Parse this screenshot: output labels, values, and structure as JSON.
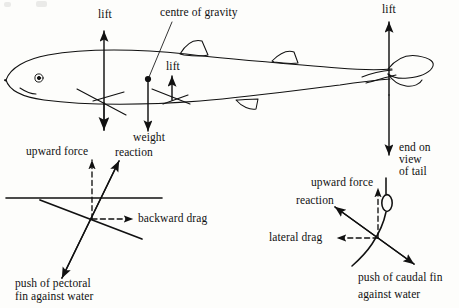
{
  "figure": {
    "domain": "diagram",
    "background_color": "#fdfdfb",
    "ink_color": "#111111"
  },
  "main_view": {
    "name": "shark-side-view",
    "labels": {
      "lift_front": "lift",
      "lift_middle": "lift",
      "lift_tail": "lift",
      "centre_of_gravity": "centre of gravity",
      "weight": "weight",
      "end_on_view_of_tail": "end on\nview\nof tail",
      "end_on_line1": "end on",
      "end_on_line2": "view",
      "end_on_line3": "of tail"
    }
  },
  "pectoral_panel": {
    "name": "pectoral-fin-section",
    "labels": {
      "upward_force": "upward force",
      "reaction": "reaction",
      "backward_drag": "backward drag",
      "push_line1": "push of pectoral",
      "push_line2": "fin against water"
    }
  },
  "caudal_panel": {
    "name": "caudal-fin-section",
    "labels": {
      "upward_force": "upward force",
      "reaction": "reaction",
      "lateral_drag": "lateral drag",
      "push_line1": "push of caudal fin",
      "push_line2": "against water"
    }
  }
}
